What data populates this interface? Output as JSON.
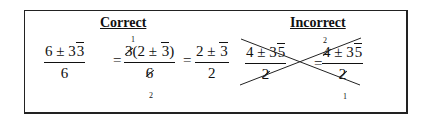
{
  "correct": {
    "heading": "Correct",
    "step1": {
      "numerator": "6 ± 3√3",
      "num_parts": [
        "6 ± 3",
        "3"
      ],
      "denominator": "6"
    },
    "equals": "=",
    "step2": {
      "numerator_prefix": "3",
      "numerator_paren": "(2 ± ",
      "numerator_rad": "3",
      "numerator_close": ")",
      "denominator": "6",
      "cancel_top": "1",
      "cancel_bottom": "2"
    },
    "step3": {
      "num_prefix": "2 ± ",
      "num_rad": "3",
      "denominator": "2"
    }
  },
  "incorrect": {
    "heading": "Incorrect",
    "left": {
      "num_prefix": "4 ± 3",
      "num_rad": "5",
      "denominator": "2"
    },
    "equals": "=",
    "right": {
      "num_first": "4",
      "num_rest": " ± 3",
      "num_rad": "5",
      "denominator": "2",
      "cancel_top": "2",
      "cancel_bottom": "1"
    },
    "crossed_out": true
  }
}
